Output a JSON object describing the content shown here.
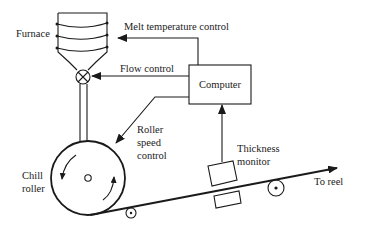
{
  "diagram": {
    "type": "process-control-schematic",
    "components": {
      "furnace": {
        "label": "Furnace"
      },
      "computer": {
        "label": "Computer"
      },
      "chill_roller": {
        "label_line1": "Chill",
        "label_line2": "roller"
      },
      "thickness_monitor": {
        "label_line1": "Thickness",
        "label_line2": "monitor"
      }
    },
    "signals": {
      "melt_temperature": {
        "label": "Melt temperature control",
        "from": "Computer",
        "to": "Furnace"
      },
      "flow": {
        "label": "Flow control",
        "from": "Computer",
        "to": "Flow valve"
      },
      "roller_speed": {
        "label_line1": "Roller",
        "label_line2": "speed",
        "label_line3": "control",
        "from": "Computer",
        "to": "Chill roller"
      },
      "thickness": {
        "from": "Thickness monitor",
        "to": "Computer"
      }
    },
    "output": {
      "label": "To reel"
    },
    "colors": {
      "line": "#1a1a1a",
      "background": "#ffffff"
    }
  }
}
